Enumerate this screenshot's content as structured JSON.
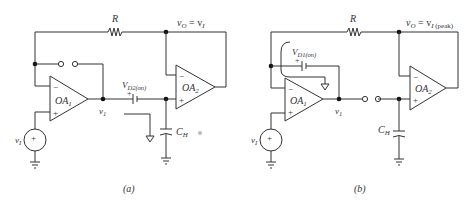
{
  "figure": {
    "panels": [
      {
        "id": "a",
        "caption": "(a)",
        "labels": {
          "resistor": "R",
          "output": "v",
          "output_sub": "O",
          "output_eq": " = v",
          "output_eq_sub": "I",
          "output_eq_sub2": "",
          "opamp1": "OA",
          "opamp1_sub": "1",
          "opamp2": "OA",
          "opamp2_sub": "2",
          "node_v1": "v",
          "node_v1_sub": "1",
          "battery": "V",
          "battery_sub": "D2(on)",
          "capacitor": "C",
          "capacitor_sub": "H",
          "source": "v",
          "source_sub": "I",
          "plus": "+",
          "minus": "−"
        }
      },
      {
        "id": "b",
        "caption": "(b)",
        "labels": {
          "resistor": "R",
          "output": "v",
          "output_sub": "O",
          "output_eq": " = v",
          "output_eq_sub": "I",
          "output_eq_sub2": " (peak)",
          "opamp1": "OA",
          "opamp1_sub": "1",
          "opamp2": "OA",
          "opamp2_sub": "2",
          "node_v1": "v",
          "node_v1_sub": "1",
          "battery": "V",
          "battery_sub": "D1(on)",
          "capacitor": "C",
          "capacitor_sub": "H",
          "source": "v",
          "source_sub": "I",
          "plus": "+",
          "minus": "−"
        }
      }
    ]
  }
}
